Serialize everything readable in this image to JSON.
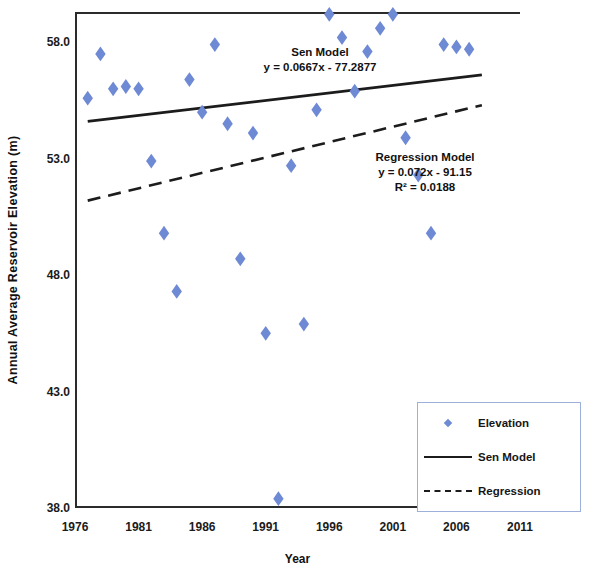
{
  "chart_data": {
    "type": "scatter",
    "title": "",
    "xlabel": "Year",
    "ylabel": "Annual Average Reservoir Elevation (m)",
    "xlim": [
      1976,
      2011
    ],
    "ylim": [
      38.0,
      59.3
    ],
    "grid": false,
    "legend_position": "bottom-right",
    "x_ticks": [
      "1976",
      "1981",
      "1986",
      "1991",
      "1996",
      "2001",
      "2006",
      "2011"
    ],
    "y_ticks": [
      "38.0",
      "43.0",
      "48.0",
      "53.0",
      "58.0"
    ],
    "marker_color": "#6f8ad4",
    "line_color": "#1c1c1c",
    "series": [
      {
        "name": "Elevation",
        "type": "scatter",
        "marker": "diamond",
        "color": "#6f8ad4",
        "points": [
          {
            "x": 1977,
            "y": 55.6
          },
          {
            "x": 1978,
            "y": 57.5
          },
          {
            "x": 1979,
            "y": 56.0
          },
          {
            "x": 1980,
            "y": 56.1
          },
          {
            "x": 1981,
            "y": 56.0
          },
          {
            "x": 1982,
            "y": 52.9
          },
          {
            "x": 1983,
            "y": 49.8
          },
          {
            "x": 1984,
            "y": 47.3
          },
          {
            "x": 1985,
            "y": 56.4
          },
          {
            "x": 1986,
            "y": 55.0
          },
          {
            "x": 1987,
            "y": 57.9
          },
          {
            "x": 1988,
            "y": 54.5
          },
          {
            "x": 1989,
            "y": 48.7
          },
          {
            "x": 1990,
            "y": 54.1
          },
          {
            "x": 1991,
            "y": 45.5
          },
          {
            "x": 1992,
            "y": 38.4
          },
          {
            "x": 1993,
            "y": 52.7
          },
          {
            "x": 1994,
            "y": 45.9
          },
          {
            "x": 1995,
            "y": 55.1
          },
          {
            "x": 1996,
            "y": 59.2
          },
          {
            "x": 1997,
            "y": 58.2
          },
          {
            "x": 1998,
            "y": 55.9
          },
          {
            "x": 1999,
            "y": 57.6
          },
          {
            "x": 2000,
            "y": 58.6
          },
          {
            "x": 2001,
            "y": 59.2
          },
          {
            "x": 2002,
            "y": 53.9
          },
          {
            "x": 2003,
            "y": 52.3
          },
          {
            "x": 2004,
            "y": 49.8
          },
          {
            "x": 2005,
            "y": 57.9
          },
          {
            "x": 2006,
            "y": 57.8
          },
          {
            "x": 2007,
            "y": 57.7
          }
        ]
      },
      {
        "name": "Sen Model",
        "type": "line",
        "style": "solid",
        "color": "#1c1c1c",
        "equation": "y = 0.0667x - 77.2877",
        "slope": 0.0667,
        "intercept": -77.2877,
        "endpoints": [
          {
            "x": 1977,
            "y": 54.6
          },
          {
            "x": 2008,
            "y": 56.6
          }
        ]
      },
      {
        "name": "Regression",
        "type": "line",
        "style": "dashed",
        "color": "#1c1c1c",
        "equation": "y = 0.072x - 91.15",
        "r_squared": 0.0188,
        "slope": 0.072,
        "intercept": -91.15,
        "endpoints": [
          {
            "x": 1977,
            "y": 51.2
          },
          {
            "x": 2008,
            "y": 55.3
          }
        ]
      }
    ],
    "annotations": [
      {
        "id": "sen",
        "lines": [
          "Sen Model",
          "y = 0.0667x - 77.2877"
        ]
      },
      {
        "id": "regression",
        "lines": [
          "Regression Model",
          "y = 0.072x - 91.15",
          "R² = 0.0188"
        ]
      }
    ]
  },
  "axes": {
    "y_title": "Annual Average Reservoir Elevation (m)",
    "x_title": "Year",
    "y_ticks": [
      {
        "label": "58.0",
        "value": 58.0
      },
      {
        "label": "53.0",
        "value": 53.0
      },
      {
        "label": "48.0",
        "value": 48.0
      },
      {
        "label": "43.0",
        "value": 43.0
      },
      {
        "label": "38.0",
        "value": 38.0
      }
    ],
    "x_ticks": [
      {
        "label": "1976",
        "value": 1976
      },
      {
        "label": "1981",
        "value": 1981
      },
      {
        "label": "1986",
        "value": 1986
      },
      {
        "label": "1991",
        "value": 1991
      },
      {
        "label": "1996",
        "value": 1996
      },
      {
        "label": "2001",
        "value": 2001
      },
      {
        "label": "2006",
        "value": 2006
      },
      {
        "label": "2011",
        "value": 2011
      }
    ]
  },
  "annotations": {
    "sen": {
      "line1": "Sen Model",
      "line2": "y = 0.0667x - 77.2877"
    },
    "regression": {
      "line1": "Regression Model",
      "line2": "y = 0.072x - 91.15",
      "line3": "R² = 0.0188"
    }
  },
  "legend": {
    "items": [
      {
        "label": "Elevation",
        "key": "diamond-marker"
      },
      {
        "label": "Sen Model",
        "key": "solid-line"
      },
      {
        "label": "Regression",
        "key": "dashed-line"
      }
    ]
  }
}
